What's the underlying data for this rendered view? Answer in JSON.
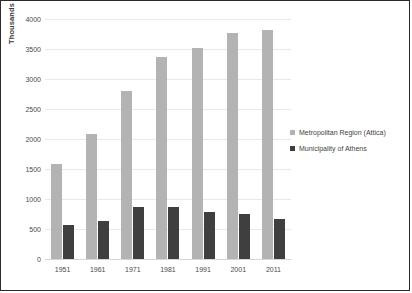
{
  "chart_data": {
    "type": "bar",
    "title": "",
    "xlabel": "",
    "ylabel": "Thousands",
    "ylim": [
      0,
      4000
    ],
    "ytick_step": 500,
    "yticks": [
      "4000",
      "3500",
      "3000",
      "2500",
      "2000",
      "1500",
      "1000",
      "500",
      "0"
    ],
    "grid": true,
    "legend_position": "right",
    "categories": [
      "1951",
      "1961",
      "1971",
      "1981",
      "1991",
      "2001",
      "2011"
    ],
    "series": [
      {
        "name": "Metropolitan  Region (Attica)",
        "color": "#b3b3b3",
        "values": [
          1580,
          2080,
          2800,
          3370,
          3520,
          3760,
          3810
        ]
      },
      {
        "name": "Municipality of Athens",
        "color": "#3f3f3f",
        "values": [
          570,
          630,
          870,
          870,
          780,
          750,
          670
        ]
      }
    ]
  }
}
